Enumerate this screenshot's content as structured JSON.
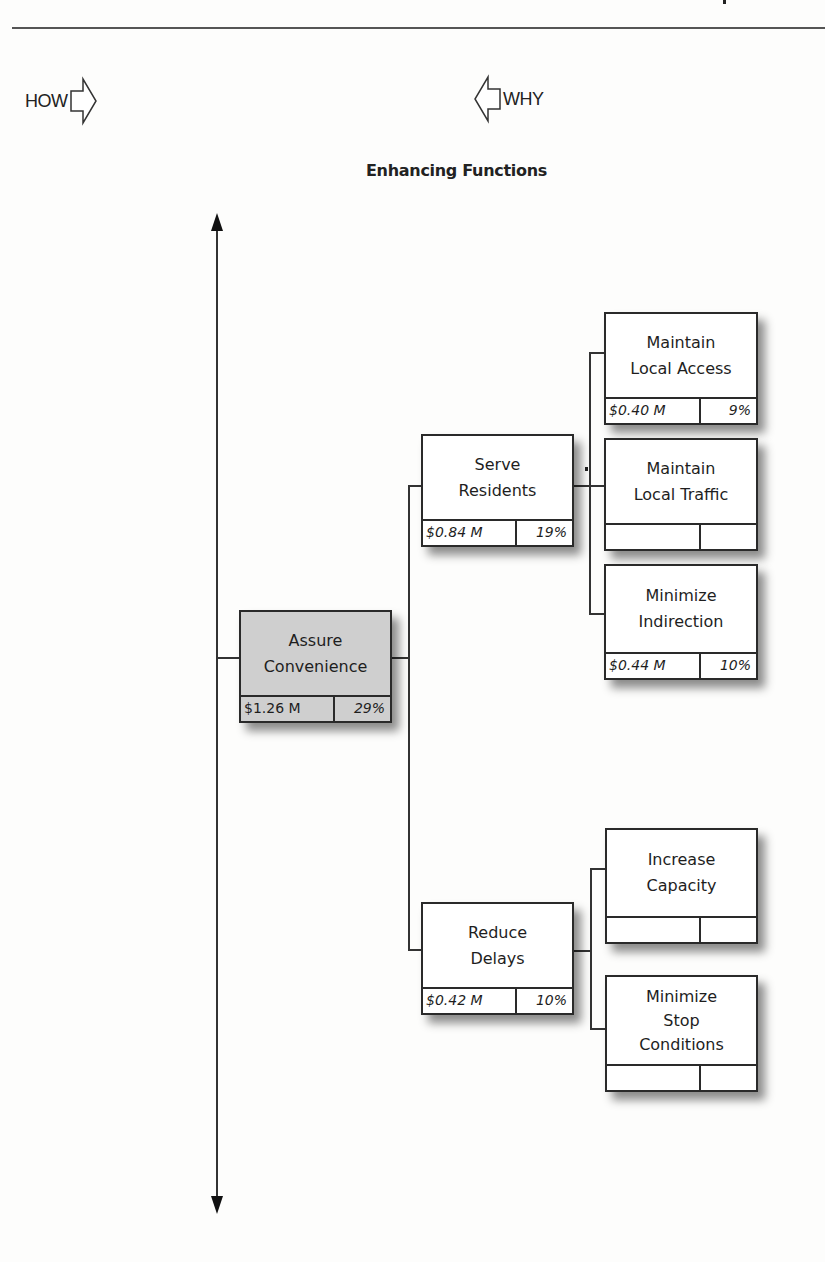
{
  "header": {
    "how_label": "HOW",
    "why_label": "WHY",
    "how_arrow_icon": "hollow-arrow-right-icon",
    "why_arrow_icon": "hollow-arrow-left-icon"
  },
  "section_title": "Enhancing Functions",
  "diagram": {
    "type": "FAST function tree",
    "axis": "vertical double-headed arrow",
    "nodes": [
      {
        "id": "assure-convenience",
        "label": "Assure\nConvenience",
        "cost": "$1.26 M",
        "percent": "29%",
        "level": 1,
        "highlighted": true
      },
      {
        "id": "serve-residents",
        "label": "Serve\nResidents",
        "cost": "$0.84 M",
        "percent": "19%",
        "level": 2,
        "parent": "assure-convenience"
      },
      {
        "id": "reduce-delays",
        "label": "Reduce\nDelays",
        "cost": "$0.42 M",
        "percent": "10%",
        "level": 2,
        "parent": "assure-convenience"
      },
      {
        "id": "maintain-local-access",
        "label": "Maintain\nLocal Access",
        "cost": "$0.40 M",
        "percent": "9%",
        "level": 3,
        "parent": "serve-residents"
      },
      {
        "id": "maintain-local-traffic",
        "label": "Maintain\nLocal Traffic",
        "cost": "",
        "percent": "",
        "level": 3,
        "parent": "serve-residents"
      },
      {
        "id": "minimize-indirection",
        "label": "Minimize\nIndirection",
        "cost": "$0.44 M",
        "percent": "10%",
        "level": 3,
        "parent": "serve-residents"
      },
      {
        "id": "increase-capacity",
        "label": "Increase\nCapacity",
        "cost": "",
        "percent": "",
        "level": 3,
        "parent": "reduce-delays"
      },
      {
        "id": "minimize-stop-conditions",
        "label": "Minimize\nStop\nConditions",
        "cost": "",
        "percent": "",
        "level": 3,
        "parent": "reduce-delays"
      }
    ]
  },
  "colors": {
    "root_fill": "#cfcfcf",
    "box_fill": "#ffffff",
    "line": "#333333"
  }
}
